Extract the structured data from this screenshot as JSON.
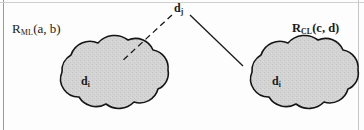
{
  "figure": {
    "width": 364,
    "height": 130,
    "background_color": "#fdfdfd",
    "border_color": "#9a9a9a"
  },
  "labels": {
    "left_region": {
      "base": "R",
      "sub": "ML",
      "args": "(a, b)"
    },
    "right_region": {
      "base": "R",
      "sub": "CL",
      "args": "(c, d)"
    },
    "top_node": {
      "base": "d",
      "sub": "j"
    },
    "left_cloud": {
      "base": "d",
      "sub": "i"
    },
    "right_cloud": {
      "base": "d",
      "sub": "i"
    }
  },
  "clouds": [
    {
      "name": "left-cloud",
      "fill": "#d2d2d2",
      "stroke": "#151515",
      "stroke_width": 1.6,
      "cx": 102,
      "cy": 88
    },
    {
      "name": "right-cloud",
      "fill": "#d2d2d2",
      "stroke": "#151515",
      "stroke_width": 1.6,
      "cx": 292,
      "cy": 88
    }
  ],
  "connectors": [
    {
      "name": "dashed-connector-left",
      "style": "dashed",
      "stroke": "#1a1a1a",
      "stroke_width": 1.3,
      "dash": "6 4",
      "x1": 172,
      "y1": 15,
      "x2": 121,
      "y2": 62
    },
    {
      "name": "solid-connector-right",
      "style": "solid",
      "stroke": "#1a1a1a",
      "stroke_width": 1.3,
      "x1": 190,
      "y1": 15,
      "x2": 243,
      "y2": 66
    }
  ]
}
